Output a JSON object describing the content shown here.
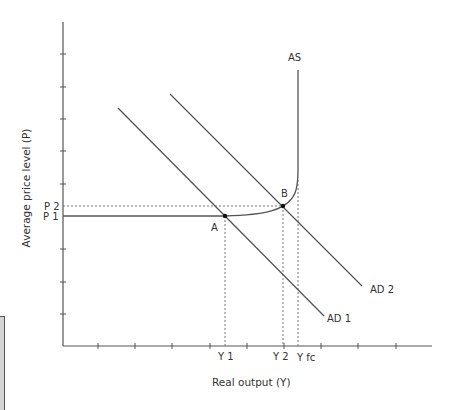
{
  "diagram": {
    "type": "AD-AS model",
    "axes": {
      "y_label": "Average price level (P)",
      "x_label": "Real output (Y)",
      "y_tick_count": 9,
      "x_tick_count": 10
    },
    "price_levels": [
      {
        "id": "p1",
        "label": "P 1"
      },
      {
        "id": "p2",
        "label": "P 2"
      }
    ],
    "output_levels": [
      {
        "id": "y1",
        "label": "Y 1"
      },
      {
        "id": "y2",
        "label": "Y 2"
      },
      {
        "id": "yfc",
        "label": "Y fc"
      }
    ],
    "curves": {
      "as": {
        "label": "AS"
      },
      "ad1": {
        "label": "AD 1"
      },
      "ad2": {
        "label": "AD 2"
      }
    },
    "points": {
      "a": {
        "label": "A"
      },
      "b": {
        "label": "B"
      }
    },
    "colors": {
      "line": "#555555",
      "text": "#333333",
      "dotted": "#777777"
    }
  }
}
